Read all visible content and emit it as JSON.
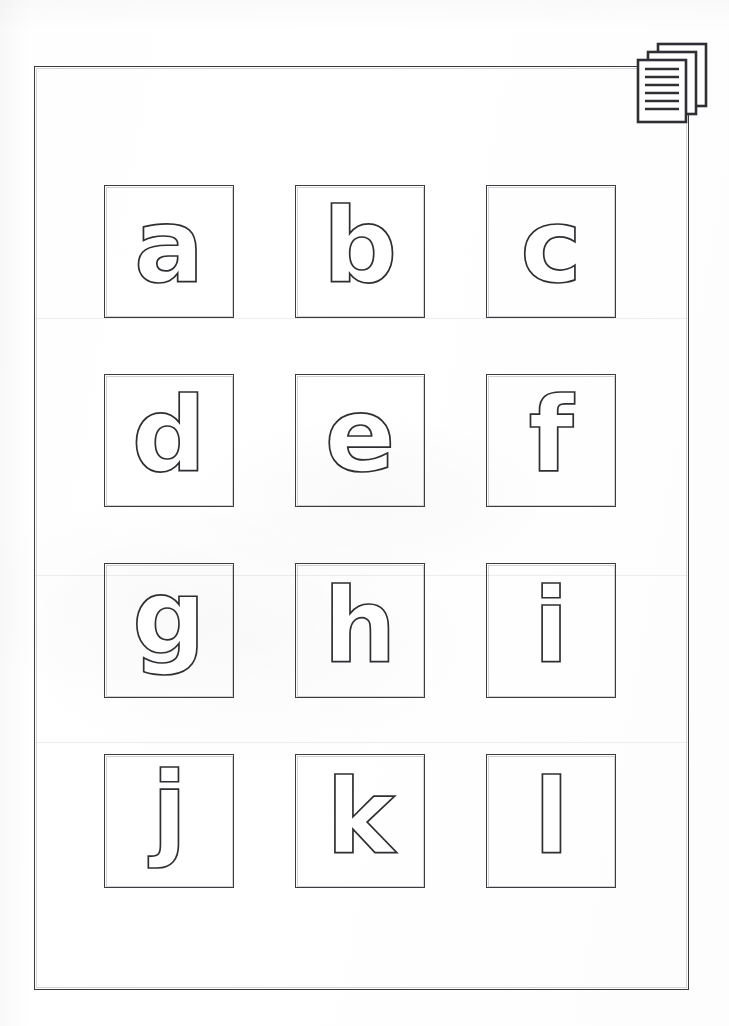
{
  "document": {
    "kind": "scanned-worksheet",
    "title": "Lowercase Alphabet Outline Letters a-l",
    "page_background": "#ffffff",
    "ink_color": "#2f2f33",
    "frame_color": "#3b3b3e",
    "letter_fill": "#ffffff",
    "letter_stroke": "#2f2f33"
  },
  "header_icon": {
    "name": "document-stack-icon",
    "label": "document-stack",
    "page_count": 3,
    "text_line_count": 6,
    "color": "#2f2f33"
  },
  "grid": {
    "columns": 3,
    "rows": 4,
    "cell_count": 12,
    "cells": [
      {
        "letter": "a",
        "name": "letter-cell-a",
        "row": 1,
        "col": 1
      },
      {
        "letter": "b",
        "name": "letter-cell-b",
        "row": 1,
        "col": 2
      },
      {
        "letter": "c",
        "name": "letter-cell-c",
        "row": 1,
        "col": 3
      },
      {
        "letter": "d",
        "name": "letter-cell-d",
        "row": 2,
        "col": 1
      },
      {
        "letter": "e",
        "name": "letter-cell-e",
        "row": 2,
        "col": 2
      },
      {
        "letter": "f",
        "name": "letter-cell-f",
        "row": 2,
        "col": 3
      },
      {
        "letter": "g",
        "name": "letter-cell-g",
        "row": 3,
        "col": 1
      },
      {
        "letter": "h",
        "name": "letter-cell-h",
        "row": 3,
        "col": 2
      },
      {
        "letter": "i",
        "name": "letter-cell-i",
        "row": 3,
        "col": 3
      },
      {
        "letter": "j",
        "name": "letter-cell-j",
        "row": 4,
        "col": 1
      },
      {
        "letter": "k",
        "name": "letter-cell-k",
        "row": 4,
        "col": 2
      },
      {
        "letter": "l",
        "name": "letter-cell-l",
        "row": 4,
        "col": 3
      }
    ]
  }
}
